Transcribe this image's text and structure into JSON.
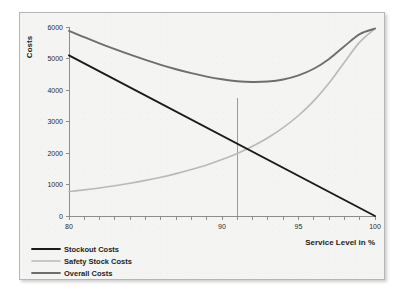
{
  "chart_data": {
    "type": "line",
    "title": "",
    "xlabel": "Service Level in %",
    "ylabel": "Costs",
    "xlim": [
      80,
      100
    ],
    "ylim": [
      0,
      6000
    ],
    "grid": false,
    "legend_position": "bottom-left",
    "x_tick_labels": [
      "80",
      "90",
      "95",
      "100"
    ],
    "x_tick_values": [
      80,
      90,
      95,
      100
    ],
    "x_minor_tick_step": 1,
    "y_tick_labels": [
      "0",
      "1000",
      "2000",
      "3000",
      "4000",
      "5000",
      "6000"
    ],
    "y_tick_values": [
      0,
      1000,
      2000,
      3000,
      4000,
      5000,
      6000
    ],
    "x": [
      80,
      81,
      82,
      83,
      84,
      85,
      86,
      87,
      88,
      89,
      90,
      91,
      92,
      93,
      94,
      95,
      96,
      97,
      98,
      99,
      100
    ],
    "series": [
      {
        "name": "Stockout Costs",
        "color": "#1a1a1a",
        "width": 1.9,
        "values": [
          5100,
          4845,
          4590,
          4335,
          4080,
          3825,
          3570,
          3315,
          3060,
          2805,
          2550,
          2295,
          2040,
          1785,
          1530,
          1275,
          1020,
          765,
          510,
          255,
          0
        ]
      },
      {
        "name": "Safety Stock Costs",
        "color": "#b9b9b7",
        "width": 1.6,
        "values": [
          780,
          830,
          890,
          960,
          1040,
          1130,
          1230,
          1345,
          1475,
          1620,
          1790,
          1985,
          2215,
          2485,
          2805,
          3190,
          3655,
          4220,
          4880,
          5520,
          5950
        ]
      },
      {
        "name": "Overall Costs",
        "color": "#6e6e6c",
        "width": 1.9,
        "values": [
          5880,
          5675,
          5480,
          5295,
          5120,
          4955,
          4800,
          4660,
          4535,
          4425,
          4340,
          4280,
          4255,
          4270,
          4335,
          4465,
          4675,
          4985,
          5390,
          5775,
          5950
        ]
      }
    ],
    "annotations": [
      {
        "name": "optimum-marker",
        "type": "vertical-line",
        "x": 91,
        "y_from": 0,
        "y_to": 3750,
        "color": "#9a9a98"
      }
    ],
    "minimum_point": {
      "x": 91,
      "y": 3750
    }
  },
  "legend": {
    "items": [
      {
        "label": "Stockout Costs"
      },
      {
        "label": "Safety Stock Costs"
      },
      {
        "label": "Overall Costs"
      }
    ]
  }
}
